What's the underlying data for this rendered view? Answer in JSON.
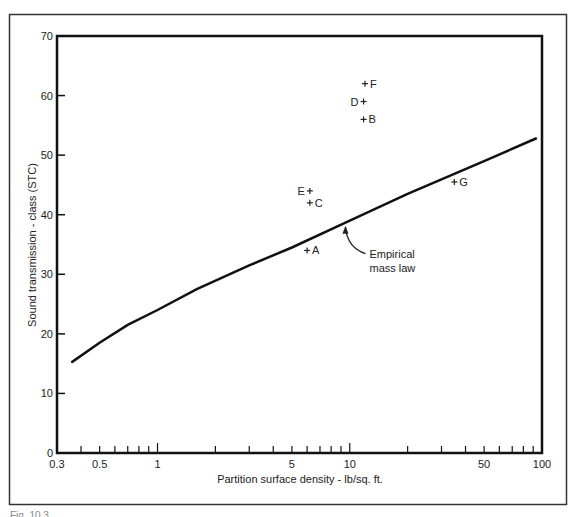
{
  "chart_data": {
    "type": "line",
    "title": "",
    "xlabel": "Partition surface density - lb/sq. ft.",
    "ylabel": "Sound transmission - class (STC)",
    "xscale": "log",
    "xlim": [
      0.3,
      100
    ],
    "ylim": [
      0,
      70
    ],
    "x_tick_labels": [
      "0.3",
      "0.5",
      "1",
      "5",
      "10",
      "50",
      "100"
    ],
    "x_tick_values": [
      0.3,
      0.5,
      1,
      5,
      10,
      50,
      100
    ],
    "x_minor_ticks": [
      0.4,
      0.6,
      0.7,
      0.8,
      0.9,
      2,
      3,
      4,
      6,
      7,
      8,
      9,
      20,
      30,
      40,
      60,
      70,
      80,
      90
    ],
    "y_tick_labels": [
      "0",
      "10",
      "20",
      "30",
      "40",
      "50",
      "60",
      "70"
    ],
    "y_tick_values": [
      0,
      10,
      20,
      30,
      40,
      50,
      60,
      70
    ],
    "grid": false,
    "series": [
      {
        "name": "Empirical mass law",
        "kind": "line",
        "x": [
          0.36,
          0.5,
          0.7,
          1,
          1.6,
          3,
          5,
          10,
          20,
          50,
          93
        ],
        "y": [
          15.3,
          18.5,
          21.5,
          24,
          27.5,
          31.5,
          34.5,
          39,
          43.5,
          49,
          52.8
        ]
      },
      {
        "name": "Measured partitions",
        "kind": "scatter",
        "marker": "+",
        "points": [
          {
            "label": "A",
            "x": 6,
            "y": 34,
            "label_side": "right"
          },
          {
            "label": "B",
            "x": 11.8,
            "y": 56,
            "label_side": "right"
          },
          {
            "label": "C",
            "x": 6.2,
            "y": 42,
            "label_side": "right"
          },
          {
            "label": "D",
            "x": 11.8,
            "y": 59,
            "label_side": "left"
          },
          {
            "label": "E",
            "x": 6.2,
            "y": 44,
            "label_side": "left"
          },
          {
            "label": "F",
            "x": 12,
            "y": 62,
            "label_side": "right"
          },
          {
            "label": "G",
            "x": 35,
            "y": 45.5,
            "label_side": "right"
          }
        ]
      }
    ],
    "annotations": [
      {
        "text_lines": [
          "Empirical",
          "mass law"
        ],
        "arrow_to_x": 9.5,
        "arrow_to_y": 38.5
      }
    ]
  },
  "caption": "Fig. 10.3"
}
